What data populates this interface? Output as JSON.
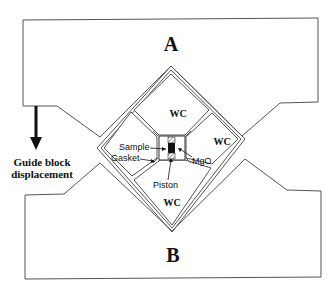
{
  "diagram": {
    "type": "anvil-press-assembly",
    "blocks": [
      {
        "id": "A",
        "label": "A"
      },
      {
        "id": "B",
        "label": "B"
      }
    ],
    "anvils": [
      {
        "position": "top",
        "label": "WC"
      },
      {
        "position": "right",
        "label": "WC"
      },
      {
        "position": "bottom",
        "label": "WC"
      },
      {
        "position": "left",
        "label": ""
      }
    ],
    "annotations": {
      "sample": "Sample",
      "gasket": "Gasket",
      "piston": "Piston",
      "mgo": "MgO"
    },
    "guide_arrow": {
      "line1": "Guide block",
      "line2": "displacement",
      "direction": "down"
    },
    "colors": {
      "line": "#555555",
      "text": "#111111",
      "sample_fill": "#111111"
    }
  }
}
